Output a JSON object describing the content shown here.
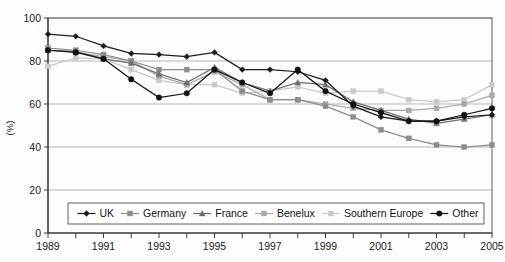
{
  "chart_data": {
    "type": "line",
    "title": "",
    "subtitle": "",
    "xlabel": "",
    "ylabel": "(%)",
    "xlim": [
      1989,
      2005
    ],
    "ylim": [
      0,
      100
    ],
    "grid": true,
    "legend_position": "bottom",
    "x": [
      1989,
      1990,
      1991,
      1992,
      1993,
      1994,
      1995,
      1996,
      1997,
      1998,
      1999,
      2000,
      2001,
      2002,
      2003,
      2004,
      2005
    ],
    "x_tick_labels": [
      "1989",
      "",
      "1991",
      "",
      "1993",
      "",
      "1995",
      "",
      "1997",
      "",
      "1999",
      "",
      "2001",
      "",
      "2003",
      "",
      "2005"
    ],
    "y_tick_labels": [
      "0",
      "20",
      "40",
      "60",
      "80",
      "100"
    ],
    "y_ticks": [
      0,
      20,
      40,
      60,
      80,
      100
    ],
    "series": [
      {
        "name": "UK",
        "color": "#1c1c1c",
        "marker": "diamond",
        "values": [
          92.5,
          91.5,
          87,
          83.5,
          83,
          82,
          84,
          76,
          76,
          75,
          71,
          59,
          54,
          52,
          52,
          54,
          55
        ]
      },
      {
        "name": "Germany",
        "color": "#8c8c8c",
        "marker": "square",
        "values": [
          86,
          85,
          83,
          80,
          76,
          76,
          76,
          66,
          62,
          62,
          59,
          54,
          48,
          44,
          41,
          40,
          41
        ]
      },
      {
        "name": "France",
        "color": "#6e6e6e",
        "marker": "triangle",
        "values": [
          85,
          84.5,
          81,
          79,
          74,
          70,
          77,
          70,
          66,
          70,
          69,
          61,
          57,
          53,
          51,
          53,
          55
        ]
      },
      {
        "name": "Benelux",
        "color": "#a8a8a8",
        "marker": "square",
        "values": [
          85,
          84,
          82,
          80,
          73,
          69,
          75,
          69,
          62,
          62,
          60,
          58,
          57,
          57,
          58,
          60,
          64
        ]
      },
      {
        "name": "Southern Europe",
        "color": "#c9c9c9",
        "marker": "square",
        "values": [
          77.5,
          81.5,
          81,
          76,
          71,
          69,
          69,
          65,
          66,
          68,
          65,
          66,
          66,
          62,
          61,
          62,
          69
        ]
      },
      {
        "name": "Other",
        "color": "#111111",
        "marker": "circle",
        "values": [
          85,
          84,
          81,
          71.5,
          63,
          65,
          76,
          70,
          65,
          76,
          66,
          60,
          56,
          52,
          52,
          55,
          58
        ]
      }
    ]
  },
  "axis": {
    "y_label": "(%)"
  },
  "legend": {
    "entries": [
      {
        "label": "UK"
      },
      {
        "label": "Germany"
      },
      {
        "label": "France"
      },
      {
        "label": "Benelux"
      },
      {
        "label": "Southern Europe"
      },
      {
        "label": "Other"
      }
    ]
  }
}
